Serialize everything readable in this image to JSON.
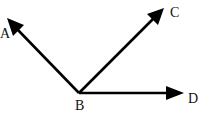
{
  "figure": {
    "type": "geometry-rays",
    "vertex": {
      "label": "B",
      "x": 79,
      "y": 93
    },
    "rays": [
      {
        "id": "BA",
        "label": "A",
        "tip": {
          "x": 7,
          "y": 19
        }
      },
      {
        "id": "BC",
        "label": "C",
        "tip": {
          "x": 164,
          "y": 8
        }
      },
      {
        "id": "BD",
        "label": "D",
        "tip": {
          "x": 183,
          "y": 93
        }
      }
    ],
    "colors": {
      "stroke": "#000000",
      "background": "#ffffff"
    }
  },
  "labels": {
    "A": "A",
    "B": "B",
    "C": "C",
    "D": "D"
  }
}
